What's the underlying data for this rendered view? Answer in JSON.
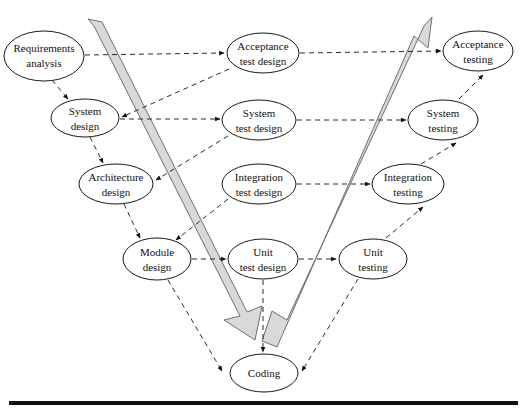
{
  "diagram": {
    "type": "v-model-flow",
    "canvas": {
      "width": 526,
      "height": 417,
      "background": "#ffffff"
    },
    "palette": {
      "node_fill": "#ffffff",
      "node_stroke": "#1a1a1a",
      "band_fill": "#d9d9d9",
      "band_stroke": "#6e6e6e",
      "link_stroke": "#2b2b2b",
      "rule_color": "#111111",
      "text_color": "#111111"
    },
    "nodes": [
      {
        "id": "requirements-analysis",
        "line1": "Requirements",
        "line2": "analysis",
        "cx": 44,
        "cy": 56,
        "rx": 40,
        "ry": 25,
        "column": "left"
      },
      {
        "id": "system-design",
        "line1": "System",
        "line2": "design",
        "cx": 85,
        "cy": 118,
        "rx": 34,
        "ry": 19,
        "column": "left"
      },
      {
        "id": "architecture-design",
        "line1": "Architecture",
        "line2": "design",
        "cx": 116,
        "cy": 184,
        "rx": 37,
        "ry": 20,
        "column": "left"
      },
      {
        "id": "module-design",
        "line1": "Module",
        "line2": "design",
        "cx": 157,
        "cy": 259,
        "rx": 34,
        "ry": 21,
        "column": "left"
      },
      {
        "id": "acceptance-test-design",
        "line1": "Acceptance",
        "line2": "test design",
        "cx": 263,
        "cy": 53,
        "rx": 36,
        "ry": 20,
        "column": "middle"
      },
      {
        "id": "system-test-design",
        "line1": "System",
        "line2": "test design",
        "cx": 259,
        "cy": 120,
        "rx": 37,
        "ry": 20,
        "column": "middle"
      },
      {
        "id": "integration-test-design",
        "line1": "Integration",
        "line2": "test design",
        "cx": 259,
        "cy": 184,
        "rx": 37,
        "ry": 20,
        "column": "middle"
      },
      {
        "id": "unit-test-design",
        "line1": "Unit",
        "line2": "test design",
        "cx": 263,
        "cy": 259,
        "rx": 35,
        "ry": 20,
        "column": "middle"
      },
      {
        "id": "coding",
        "line1": "Coding",
        "line2": "",
        "cx": 264,
        "cy": 373,
        "rx": 34,
        "ry": 19,
        "column": "bottom"
      },
      {
        "id": "acceptance-testing",
        "line1": "Acceptance",
        "line2": "testing",
        "cx": 478,
        "cy": 51,
        "rx": 35,
        "ry": 20,
        "column": "right"
      },
      {
        "id": "system-testing",
        "line1": "System",
        "line2": "testing",
        "cx": 443,
        "cy": 120,
        "rx": 35,
        "ry": 20,
        "column": "right"
      },
      {
        "id": "integration-testing",
        "line1": "Integration",
        "line2": "testing",
        "cx": 408,
        "cy": 184,
        "rx": 36,
        "ry": 20,
        "column": "right"
      },
      {
        "id": "unit-testing",
        "line1": "Unit",
        "line2": "testing",
        "cx": 373,
        "cy": 259,
        "rx": 34,
        "ry": 20,
        "column": "right"
      }
    ],
    "links": [
      {
        "id": "link-requirements-to-system-design",
        "from": "requirements-analysis",
        "to": "system-design"
      },
      {
        "id": "link-system-design-to-architecture-design",
        "from": "system-design",
        "to": "architecture-design"
      },
      {
        "id": "link-architecture-design-to-module-design",
        "from": "architecture-design",
        "to": "module-design"
      },
      {
        "id": "link-module-design-to-coding",
        "from": "module-design",
        "to": "coding"
      },
      {
        "id": "link-requirements-to-acceptance-test-design",
        "from": "requirements-analysis",
        "to": "acceptance-test-design"
      },
      {
        "id": "link-acceptance-test-design-to-system-design",
        "from": "acceptance-test-design",
        "to": "system-design"
      },
      {
        "id": "link-system-design-to-system-test-design",
        "from": "system-design",
        "to": "system-test-design"
      },
      {
        "id": "link-system-test-design-to-architecture-design",
        "from": "system-test-design",
        "to": "architecture-design"
      },
      {
        "id": "link-integration-test-design-to-module-design",
        "from": "integration-test-design",
        "to": "module-design"
      },
      {
        "id": "link-module-design-to-unit-test-design",
        "from": "module-design",
        "to": "unit-test-design"
      },
      {
        "id": "link-unit-test-design-to-coding",
        "from": "unit-test-design",
        "to": "coding"
      },
      {
        "id": "link-acceptance-test-design-to-acceptance-testing",
        "from": "acceptance-test-design",
        "to": "acceptance-testing"
      },
      {
        "id": "link-system-test-design-to-system-testing",
        "from": "system-test-design",
        "to": "system-testing"
      },
      {
        "id": "link-integration-test-design-to-integration-testing",
        "from": "integration-test-design",
        "to": "integration-testing"
      },
      {
        "id": "link-unit-test-design-to-unit-testing",
        "from": "unit-test-design",
        "to": "unit-testing"
      },
      {
        "id": "link-coding-to-unit-testing",
        "from": "coding",
        "to": "unit-testing"
      },
      {
        "id": "link-unit-testing-to-integration-testing",
        "from": "unit-testing",
        "to": "integration-testing"
      },
      {
        "id": "link-integration-testing-to-system-testing",
        "from": "integration-testing",
        "to": "system-testing"
      },
      {
        "id": "link-system-testing-to-acceptance-testing",
        "from": "system-testing",
        "to": "acceptance-testing"
      }
    ],
    "bands": [
      {
        "id": "verification-band",
        "direction": "down-right",
        "label": "descending grey arrow from top-left to coding"
      },
      {
        "id": "validation-band",
        "direction": "up-right",
        "label": "ascending grey arrow from coding to acceptance testing"
      }
    ],
    "baseline": {
      "id": "bottom-rule",
      "label": "horizontal rule"
    }
  }
}
